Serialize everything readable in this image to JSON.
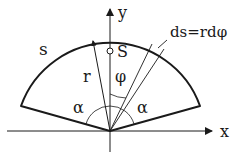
{
  "diagram": {
    "labels": {
      "arc": "s",
      "y_axis": "y",
      "x_axis": "x",
      "radius": "r",
      "centroid": "S",
      "phi": "φ",
      "alpha_left": "α",
      "alpha_right": "α",
      "element": "ds=rdφ"
    },
    "colors": {
      "stroke": "#1a1a1a",
      "background": "#ffffff"
    }
  }
}
